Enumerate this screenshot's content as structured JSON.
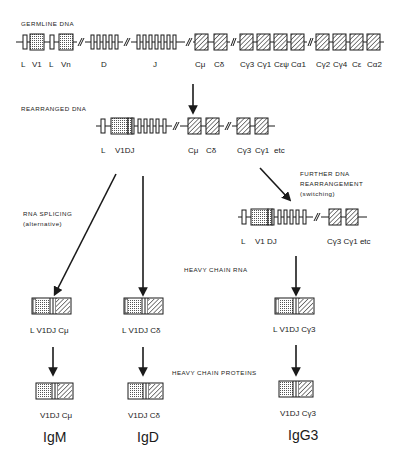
{
  "colors": {
    "ink": "#1a1a1a",
    "background": "#ffffff"
  },
  "germline": {
    "heading": "GERMLINE DNA",
    "labels": [
      "L",
      "V1",
      "L",
      "Vn",
      "D",
      "J",
      "Cμ",
      "Cδ",
      "Cγ3",
      "Cγ1",
      "Cεψ",
      "Cα1",
      "Cγ2",
      "Cγ4",
      "Cε",
      "Cα2"
    ]
  },
  "rearranged": {
    "heading": "REARRANGED DNA",
    "labels": {
      "L": "L",
      "vdj": "V1DJ",
      "cmu": "Cμ",
      "cdelta": "Cδ",
      "cg3": "Cγ3",
      "cg1": "Cγ1",
      "etc": "etc"
    }
  },
  "annotations": {
    "splicing_line1": "RNA SPLICING",
    "splicing_line2": "(alternative)",
    "switch_line1": "FURTHER DNA",
    "switch_line2": "REARRANGEMENT",
    "switch_line3": "(switching)",
    "heavy_chain_rna": "HEAVY CHAIN RNA",
    "heavy_chain_proteins": "HEAVY CHAIN PROTEINS"
  },
  "switched": {
    "labels": {
      "L": "L",
      "vdj": "V1 DJ",
      "cg": "Cγ3 Cγ1 etc"
    }
  },
  "rna": [
    {
      "label": "L V1DJ Cμ"
    },
    {
      "label": "L V1DJ Cδ"
    },
    {
      "label": "L V1DJ Cγ3"
    }
  ],
  "proteins": [
    {
      "label": "V1DJ Cμ",
      "isotype": "IgM"
    },
    {
      "label": "V1DJ Cδ",
      "isotype": "IgD"
    },
    {
      "label": "V1DJ Cγ3",
      "isotype": "IgG3"
    }
  ]
}
